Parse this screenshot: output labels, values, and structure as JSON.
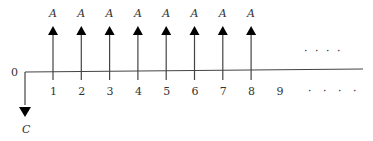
{
  "diagram": {
    "type": "cash-flow-diagram",
    "origin_label": "0",
    "initial_outflow_label": "C",
    "inflow_label": "A",
    "periods": [
      "1",
      "2",
      "3",
      "4",
      "5",
      "6",
      "7",
      "8",
      "9"
    ],
    "inflow_periods": [
      "1",
      "2",
      "3",
      "4",
      "5",
      "6",
      "7",
      "8"
    ],
    "continuation_dots_upper": "· · · ·",
    "continuation_dots_lower": "· · · ·",
    "colors": {
      "line": "#444444",
      "arrow": "#000000",
      "text": "#333333"
    }
  }
}
